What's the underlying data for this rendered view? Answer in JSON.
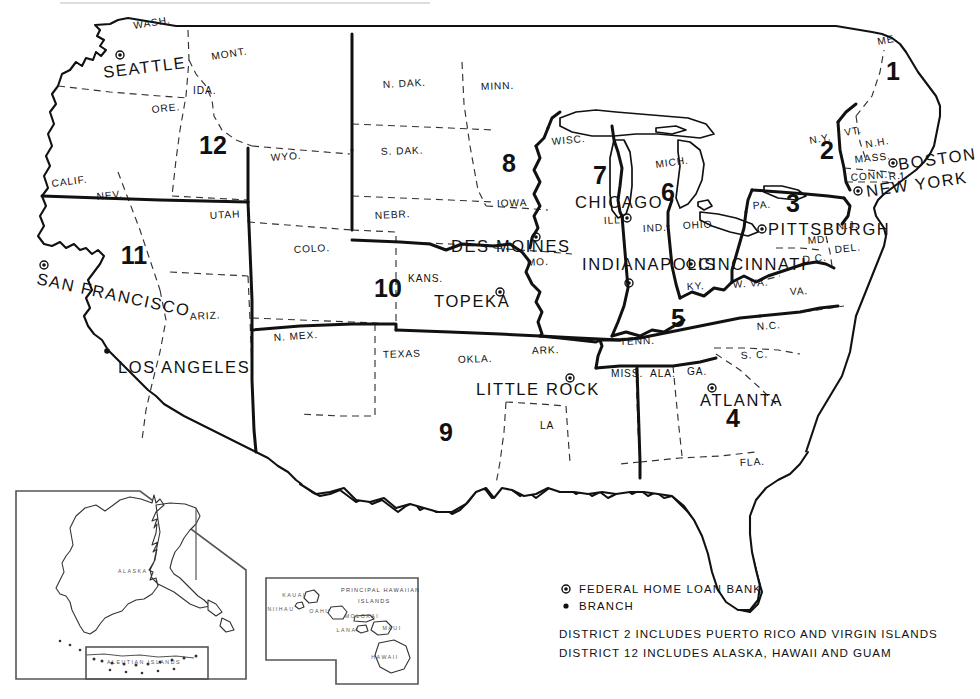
{
  "map": {
    "title": "Federal Home Loan Bank Districts",
    "legend": {
      "items": [
        {
          "symbol": "bank-symbol",
          "label": "FEDERAL HOME LOAN BANK"
        },
        {
          "symbol": "branch-symbol",
          "label": "BRANCH"
        }
      ],
      "notes": [
        "DISTRICT 2 INCLUDES PUERTO RICO AND VIRGIN ISLANDS",
        "DISTRICT 12 INCLUDES ALASKA, HAWAII AND GUAM"
      ]
    },
    "districts": [
      {
        "number": "1",
        "x": 893,
        "y": 80
      },
      {
        "number": "2",
        "x": 827,
        "y": 159
      },
      {
        "number": "3",
        "x": 793,
        "y": 212
      },
      {
        "number": "4",
        "x": 733,
        "y": 427
      },
      {
        "number": "5",
        "x": 678,
        "y": 327
      },
      {
        "number": "6",
        "x": 668,
        "y": 201
      },
      {
        "number": "7",
        "x": 600,
        "y": 184
      },
      {
        "number": "8",
        "x": 509,
        "y": 172
      },
      {
        "number": "9",
        "x": 446,
        "y": 441
      },
      {
        "number": "10",
        "x": 388,
        "y": 297
      },
      {
        "number": "11",
        "x": 134,
        "y": 264
      },
      {
        "number": "12",
        "x": 213,
        "y": 154
      }
    ],
    "banks": [
      {
        "name": "SEATTLE",
        "label_x": 104,
        "label_y": 78,
        "dot_x": 120,
        "dot_y": 55,
        "anchor": "start",
        "rotate": -7
      },
      {
        "name": "SAN FRANCISCO",
        "label_x": 36,
        "label_y": 284,
        "dot_x": 44,
        "dot_y": 265,
        "anchor": "start",
        "rotate": 12
      },
      {
        "name": "TOPEKA",
        "label_x": 434,
        "label_y": 307,
        "dot_x": 500,
        "dot_y": 292,
        "anchor": "start",
        "rotate": 0
      },
      {
        "name": "LITTLE ROCK",
        "label_x": 476,
        "label_y": 395,
        "dot_x": 570,
        "dot_y": 378,
        "anchor": "start",
        "rotate": 0
      },
      {
        "name": "DES MOINES",
        "label_x": 451,
        "label_y": 252,
        "dot_x": 536,
        "dot_y": 237,
        "anchor": "start",
        "rotate": 0
      },
      {
        "name": "CHICAGO",
        "label_x": 575,
        "label_y": 208,
        "dot_x": 627,
        "dot_y": 218,
        "anchor": "start",
        "rotate": 0
      },
      {
        "name": "INDIANAPOLIS",
        "label_x": 582,
        "label_y": 270,
        "dot_x": 629,
        "dot_y": 283,
        "anchor": "start",
        "rotate": 0
      },
      {
        "name": "CINCINNATI",
        "label_x": 698,
        "label_y": 270,
        "dot_x": 691,
        "dot_y": 264,
        "anchor": "start",
        "rotate": 0
      },
      {
        "name": "PITTSBURGH",
        "label_x": 768,
        "label_y": 235,
        "dot_x": 762,
        "dot_y": 229,
        "anchor": "start",
        "rotate": 0
      },
      {
        "name": "ATLANTA",
        "label_x": 700,
        "label_y": 406,
        "dot_x": 712,
        "dot_y": 388,
        "anchor": "start",
        "rotate": 0
      },
      {
        "name": "BOSTON",
        "label_x": 899,
        "label_y": 170,
        "dot_x": 893,
        "dot_y": 163,
        "anchor": "start",
        "rotate": -8
      },
      {
        "name": "NEW YORK",
        "label_x": 867,
        "label_y": 197,
        "dot_x": 858,
        "dot_y": 191,
        "anchor": "start",
        "rotate": -8
      }
    ],
    "branches": [
      {
        "name": "LOS ANGELES",
        "label_x": 118,
        "label_y": 373,
        "dot_x": 107,
        "dot_y": 351,
        "anchor": "start",
        "rotate": 0
      }
    ],
    "states": [
      {
        "abbr": "WASH.",
        "x": 134,
        "y": 29,
        "rotate": -9
      },
      {
        "abbr": "ORE.",
        "x": 152,
        "y": 113,
        "rotate": -6
      },
      {
        "abbr": "IDA.",
        "x": 193,
        "y": 94,
        "rotate": 0
      },
      {
        "abbr": "MONT.",
        "x": 212,
        "y": 60,
        "rotate": -9
      },
      {
        "abbr": "WYO.",
        "x": 271,
        "y": 161,
        "rotate": -4
      },
      {
        "abbr": "UTAH",
        "x": 210,
        "y": 219,
        "rotate": -3
      },
      {
        "abbr": "NEV.",
        "x": 97,
        "y": 200,
        "rotate": -6
      },
      {
        "abbr": "CALIF.",
        "x": 52,
        "y": 187,
        "rotate": -7
      },
      {
        "abbr": "ARIZ.",
        "x": 190,
        "y": 320,
        "rotate": -3
      },
      {
        "abbr": "COLO.",
        "x": 294,
        "y": 253,
        "rotate": -3
      },
      {
        "abbr": "N. MEX.",
        "x": 274,
        "y": 341,
        "rotate": -4
      },
      {
        "abbr": "N. DAK.",
        "x": 383,
        "y": 88,
        "rotate": -3
      },
      {
        "abbr": "S. DAK.",
        "x": 381,
        "y": 155,
        "rotate": -2
      },
      {
        "abbr": "NEBR.",
        "x": 375,
        "y": 219,
        "rotate": -3
      },
      {
        "abbr": "KANS.",
        "x": 408,
        "y": 282,
        "rotate": 0
      },
      {
        "abbr": "OKLA.",
        "x": 458,
        "y": 363,
        "rotate": -2
      },
      {
        "abbr": "TEXAS",
        "x": 383,
        "y": 358,
        "rotate": -2
      },
      {
        "abbr": "MINN.",
        "x": 481,
        "y": 90,
        "rotate": -2
      },
      {
        "abbr": "IOWA",
        "x": 497,
        "y": 207,
        "rotate": -2
      },
      {
        "abbr": "MO.",
        "x": 527,
        "y": 266,
        "rotate": -3
      },
      {
        "abbr": "ARK.",
        "x": 532,
        "y": 354,
        "rotate": -2
      },
      {
        "abbr": "LA",
        "x": 540,
        "y": 429,
        "rotate": 0
      },
      {
        "abbr": "WISC.",
        "x": 552,
        "y": 145,
        "rotate": -5
      },
      {
        "abbr": "ILL.",
        "x": 604,
        "y": 224,
        "rotate": -3
      },
      {
        "abbr": "IND.",
        "x": 643,
        "y": 232,
        "rotate": -3
      },
      {
        "abbr": "MICH.",
        "x": 656,
        "y": 168,
        "rotate": -8
      },
      {
        "abbr": "OHIO",
        "x": 683,
        "y": 229,
        "rotate": -3
      },
      {
        "abbr": "KY.",
        "x": 687,
        "y": 290,
        "rotate": -3
      },
      {
        "abbr": "TENN.",
        "x": 620,
        "y": 345,
        "rotate": -2
      },
      {
        "abbr": "MISS.",
        "x": 611,
        "y": 377,
        "rotate": 0
      },
      {
        "abbr": "ALA.",
        "x": 650,
        "y": 377,
        "rotate": 0
      },
      {
        "abbr": "GA.",
        "x": 687,
        "y": 375,
        "rotate": 0
      },
      {
        "abbr": "FLA.",
        "x": 740,
        "y": 466,
        "rotate": -3
      },
      {
        "abbr": "S. C.",
        "x": 741,
        "y": 359,
        "rotate": -3
      },
      {
        "abbr": "N.C.",
        "x": 757,
        "y": 330,
        "rotate": -4
      },
      {
        "abbr": "VA.",
        "x": 790,
        "y": 295,
        "rotate": -3
      },
      {
        "abbr": "W. VA.",
        "x": 733,
        "y": 288,
        "rotate": -4
      },
      {
        "abbr": "PA.",
        "x": 753,
        "y": 209,
        "rotate": -4
      },
      {
        "abbr": "MD.",
        "x": 808,
        "y": 244,
        "rotate": -5
      },
      {
        "abbr": "DEL.",
        "x": 835,
        "y": 253,
        "rotate": -6
      },
      {
        "abbr": "D.C.",
        "x": 803,
        "y": 263,
        "rotate": -6
      },
      {
        "abbr": "N.J.",
        "x": 837,
        "y": 230,
        "rotate": -6
      },
      {
        "abbr": "N.Y.",
        "x": 810,
        "y": 144,
        "rotate": -10
      },
      {
        "abbr": "VT.",
        "x": 845,
        "y": 136,
        "rotate": -10
      },
      {
        "abbr": "N.H.",
        "x": 866,
        "y": 148,
        "rotate": -10
      },
      {
        "abbr": "ME.",
        "x": 878,
        "y": 45,
        "rotate": -10
      },
      {
        "abbr": "MASS.",
        "x": 855,
        "y": 163,
        "rotate": -6
      },
      {
        "abbr": "CONN.",
        "x": 851,
        "y": 181,
        "rotate": -5
      },
      {
        "abbr": "R.I.",
        "x": 889,
        "y": 180,
        "rotate": -5
      }
    ],
    "insets": {
      "alaska": {
        "title": "ALASKA",
        "sub": "ALEUTIAN ISLANDS"
      },
      "hawaii": {
        "title_line1": "PRINCIPAL   HAWAIIAN",
        "title_line2": "ISLANDS",
        "islands": [
          {
            "name": "KAUAI",
            "x": 294,
            "y": 597
          },
          {
            "name": "NIIHAU",
            "x": 281,
            "y": 611
          },
          {
            "name": "OAHU",
            "x": 320,
            "y": 613
          },
          {
            "name": "MOLOKAI",
            "x": 362,
            "y": 618
          },
          {
            "name": "LANAI",
            "x": 348,
            "y": 632
          },
          {
            "name": "MAUI",
            "x": 392,
            "y": 630
          },
          {
            "name": "HAWAII",
            "x": 385,
            "y": 659
          }
        ]
      }
    },
    "colors": {
      "ink": "#111111",
      "state_border": "#333333",
      "inset_gray": "#555555",
      "background": "#ffffff"
    }
  }
}
